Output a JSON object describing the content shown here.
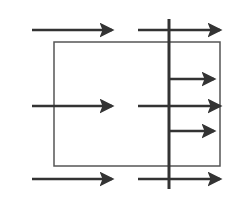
{
  "diagram": {
    "type": "flow-arrows-with-barrier",
    "colors": {
      "background": "#ffffff",
      "arrow": "#333333",
      "barrier": "#333333",
      "frame": "#555555"
    },
    "barrier": {
      "x": 169,
      "y1": 19,
      "y2": 189,
      "width": 3
    },
    "frame": {
      "x": 54,
      "y": 42,
      "width": 166,
      "height": 124,
      "stroke_width": 1.5
    },
    "arrows": [
      {
        "id": "top-left",
        "x1": 32,
        "y": 30,
        "x2": 118
      },
      {
        "id": "top-right",
        "x1": 138,
        "y": 30,
        "x2": 226
      },
      {
        "id": "upper-small",
        "x1": 170,
        "y": 79,
        "x2": 220
      },
      {
        "id": "middle-left",
        "x1": 32,
        "y": 106,
        "x2": 118
      },
      {
        "id": "middle-right",
        "x1": 138,
        "y": 106,
        "x2": 226
      },
      {
        "id": "lower-small",
        "x1": 170,
        "y": 131,
        "x2": 220
      },
      {
        "id": "bottom-left",
        "x1": 32,
        "y": 179,
        "x2": 118
      },
      {
        "id": "bottom-right",
        "x1": 138,
        "y": 179,
        "x2": 226
      }
    ]
  }
}
